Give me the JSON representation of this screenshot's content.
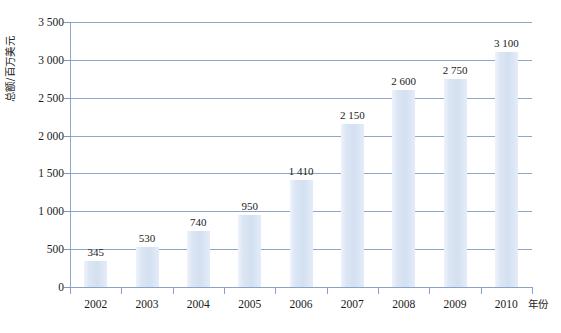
{
  "chart_data": {
    "type": "bar",
    "title": "",
    "subtitle": "",
    "xlabel": "年份",
    "ylabel": "总额/百万美元",
    "categories": [
      "2002",
      "2003",
      "2004",
      "2005",
      "2006",
      "2007",
      "2008",
      "2009",
      "2010"
    ],
    "values": [
      345,
      530,
      740,
      950,
      1410,
      2150,
      2600,
      2750,
      3100
    ],
    "value_labels": [
      "345",
      "530",
      "740",
      "950",
      "1 410",
      "2 150",
      "2 600",
      "2 750",
      "3 100"
    ],
    "ylim": [
      0,
      3500
    ],
    "ytick_values": [
      0,
      500,
      1000,
      1500,
      2000,
      2500,
      3000,
      3500
    ],
    "ytick_labels": [
      "0",
      "500",
      "1 000",
      "1 500",
      "2 000",
      "2 500",
      "3 000",
      "3 500"
    ],
    "grid": true,
    "legend": false,
    "legend_position": "none",
    "series": [
      {
        "name": "",
        "values": [
          345,
          530,
          740,
          950,
          1410,
          2150,
          2600,
          2750,
          3100
        ]
      }
    ],
    "colors": {
      "bar_fill": "#dce6f4",
      "bar_fill_light": "#eef3fb",
      "gridline": "#7a96c2",
      "axis": "#8aa2c6",
      "text": "#1a1a1a",
      "background": "#ffffff"
    }
  }
}
